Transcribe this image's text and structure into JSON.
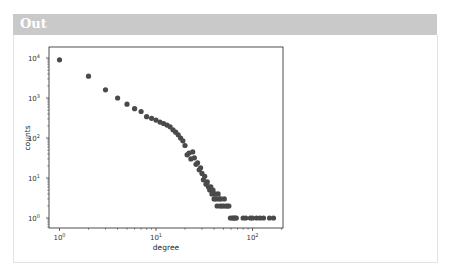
{
  "output": {
    "label": "Out"
  },
  "colors": {
    "header_bg": "#c9c9c9",
    "marker": "#4a4a4a",
    "axes": "#222222"
  },
  "chart_data": {
    "type": "scatter",
    "title": "",
    "xlabel": "degree",
    "ylabel": "counts",
    "xscale": "log",
    "yscale": "log",
    "xlim": [
      0.8,
      200
    ],
    "ylim": [
      0.7,
      14000
    ],
    "xticks": [
      {
        "value": 1,
        "label": "10",
        "exp": "0"
      },
      {
        "value": 10,
        "label": "10",
        "exp": "1"
      },
      {
        "value": 100,
        "label": "10",
        "exp": "2"
      }
    ],
    "yticks": [
      {
        "value": 1,
        "label": "10",
        "exp": "0"
      },
      {
        "value": 10,
        "label": "10",
        "exp": "1"
      },
      {
        "value": 100,
        "label": "10",
        "exp": "2"
      },
      {
        "value": 1000,
        "label": "10",
        "exp": "3"
      },
      {
        "value": 10000,
        "label": "10",
        "exp": "4"
      }
    ],
    "grid": false,
    "legend": null,
    "series": [
      {
        "name": "degree distribution",
        "x": [
          1,
          2,
          3,
          4,
          5,
          6,
          7,
          8,
          9,
          10,
          11,
          12,
          13,
          14,
          15,
          16,
          17,
          18,
          19,
          20,
          21,
          22,
          23,
          24,
          25,
          26,
          27,
          28,
          29,
          30,
          31,
          32,
          33,
          34,
          35,
          36,
          37,
          38,
          39,
          40,
          41,
          42,
          43,
          44,
          45,
          46,
          47,
          48,
          50,
          51,
          53,
          55,
          57,
          59,
          62,
          64,
          66,
          68,
          80,
          85,
          95,
          100,
          110,
          120,
          130,
          150,
          165
        ],
        "y": [
          9000,
          3500,
          1600,
          1000,
          700,
          540,
          460,
          340,
          310,
          280,
          250,
          230,
          210,
          190,
          160,
          140,
          120,
          100,
          85,
          65,
          38,
          42,
          30,
          45,
          32,
          22,
          24,
          16,
          18,
          13,
          9,
          11,
          7,
          8,
          6,
          5,
          6,
          4,
          5,
          3,
          4,
          3,
          2,
          4,
          3,
          2,
          3,
          2,
          2,
          3,
          2,
          2,
          2,
          1,
          1,
          1,
          1,
          1,
          1,
          1,
          1,
          1,
          1,
          1,
          1,
          1,
          1
        ]
      }
    ]
  }
}
